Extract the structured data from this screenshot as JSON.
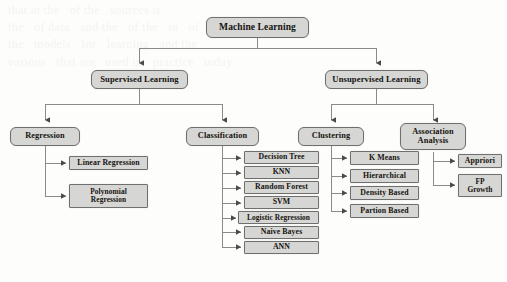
{
  "diagram": {
    "type": "tree",
    "colors": {
      "node_fill": "#d6d6d4",
      "node_border": "#6f6f6f",
      "connector": "#8a8a8a",
      "text": "#15130f",
      "background": "#fdfdfc"
    },
    "background_ghost_text": "that at the   of the   sources is\nthe   of data   and the   of the   in   of\nthe   models   for   learning   and the\nvarious   that are   used in   practice   today\n\n\n\n\n\n\n\n"
  },
  "nodes": {
    "root": {
      "label": "Machine Learning"
    },
    "level1": [
      {
        "id": "supervised",
        "label": "Supervised Learning"
      },
      {
        "id": "unsupervised",
        "label": "Unsupervised Learning"
      }
    ],
    "level2": [
      {
        "id": "regression",
        "label": "Regression",
        "parent": "supervised"
      },
      {
        "id": "classification",
        "label": "Classification",
        "parent": "supervised"
      },
      {
        "id": "clustering",
        "label": "Clustering",
        "parent": "unsupervised"
      },
      {
        "id": "association",
        "label": "Association Analysis",
        "line1": "Association",
        "line2": "Analysis",
        "parent": "unsupervised"
      }
    ],
    "regression_children": [
      {
        "id": "linear-regression",
        "label": "Linear Regression"
      },
      {
        "id": "polynomial-regression",
        "label": "Polynomial Regression",
        "line1": "Polynomial",
        "line2": "Regression"
      }
    ],
    "classification_children": [
      {
        "id": "decision-tree",
        "label": "Decision Tree"
      },
      {
        "id": "knn",
        "label": "KNN"
      },
      {
        "id": "random-forest",
        "label": "Random Forest"
      },
      {
        "id": "svm",
        "label": "SVM"
      },
      {
        "id": "logistic-regression",
        "label": "Logistic Regression"
      },
      {
        "id": "naive-bayes",
        "label": "Naive Bayes"
      },
      {
        "id": "ann",
        "label": "ANN"
      }
    ],
    "clustering_children": [
      {
        "id": "k-means",
        "label": "K Means"
      },
      {
        "id": "hierarchical",
        "label": "Hierarchical"
      },
      {
        "id": "density-based",
        "label": "Density Based"
      },
      {
        "id": "partion-based",
        "label": "Partion Based"
      }
    ],
    "association_children": [
      {
        "id": "appriori",
        "label": "Appriori"
      },
      {
        "id": "fp-growth",
        "label": "FP Growth",
        "line1": "FP",
        "line2": "Growth"
      }
    ]
  }
}
